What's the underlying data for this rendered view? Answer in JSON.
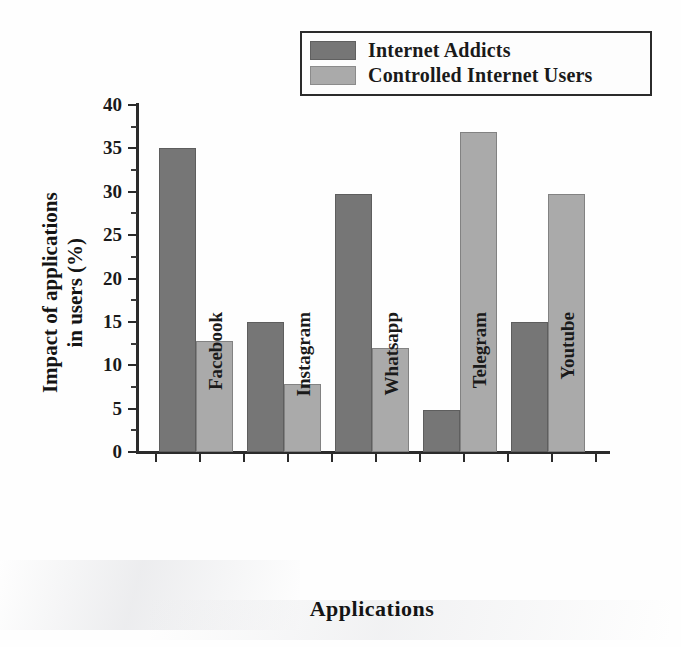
{
  "chart_data": {
    "type": "bar",
    "title": "",
    "xlabel": "Applications",
    "ylabel": "Impact of applications in users (%)",
    "ylabel_line1": "Impact of applications",
    "ylabel_line2": "in users (%)",
    "categories": [
      "Facebook",
      "Instagram",
      "Whatsapp",
      "Telegram",
      "Youtube"
    ],
    "series": [
      {
        "name": "Internet Addicts",
        "color": "#767676",
        "values": [
          35,
          15,
          29.8,
          4.8,
          15
        ]
      },
      {
        "name": "Controlled Internet Users",
        "color": "#aaaaaa",
        "values": [
          12.8,
          7.8,
          12,
          36.9,
          29.8
        ]
      }
    ],
    "ylim": [
      0,
      40
    ],
    "ytick_step": 5,
    "ytick_minor_step": 2.5,
    "yticks": [
      "0",
      "5",
      "10",
      "15",
      "20",
      "25",
      "30",
      "35",
      "40"
    ],
    "grid": false,
    "legend_position": "top-right",
    "legend_border_color": "#2b2b2b",
    "axis_color": "#2b2b2b",
    "background": "#ffffff"
  },
  "legend": {
    "entries": [
      {
        "label": "Internet Addicts",
        "color": "#767676"
      },
      {
        "label": "Controlled Internet Users",
        "color": "#aaaaaa"
      }
    ]
  }
}
